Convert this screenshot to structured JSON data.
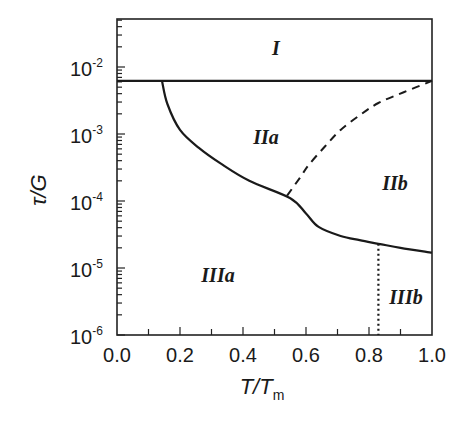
{
  "chart_data": {
    "type": "line",
    "title": "",
    "xlabel": "T/T_m",
    "xlabel_main": "T/T",
    "xlabel_sub": "m",
    "ylabel": "τ/G",
    "xlim": [
      0.0,
      1.0
    ],
    "ylim": [
      1e-06,
      0.05
    ],
    "yscale": "log",
    "grid": false,
    "legend": null,
    "x_ticks": [
      "0.0",
      "0.2",
      "0.4",
      "0.6",
      "0.8",
      "1.0"
    ],
    "y_ticks": [
      {
        "base": "10",
        "exp": "-2",
        "value": 0.01
      },
      {
        "base": "10",
        "exp": "-3",
        "value": 0.001
      },
      {
        "base": "10",
        "exp": "-4",
        "value": 0.0001
      },
      {
        "base": "10",
        "exp": "-5",
        "value": 1e-05
      },
      {
        "base": "10",
        "exp": "-6",
        "value": 1e-06
      }
    ],
    "series": [
      {
        "name": "upper boundary (I / II)",
        "style": "solid",
        "x": [
          0.0,
          1.0
        ],
        "y": [
          0.0062,
          0.0062
        ]
      },
      {
        "name": "lower boundary (II / III)",
        "style": "solid",
        "x": [
          0.143,
          0.16,
          0.2,
          0.26,
          0.33,
          0.42,
          0.55,
          0.6,
          0.64,
          0.71,
          0.77,
          0.83,
          0.9,
          1.0
        ],
        "y": [
          0.0062,
          0.0028,
          0.00115,
          0.00062,
          0.00036,
          0.0002,
          0.00011,
          6.5e-05,
          4.1e-05,
          3e-05,
          2.6e-05,
          2.3e-05,
          2e-05,
          1.7e-05
        ]
      },
      {
        "name": "IIa / IIb boundary",
        "style": "dashed",
        "x": [
          0.54,
          0.58,
          0.61,
          0.66,
          0.71,
          0.77,
          0.83,
          0.91,
          1.0
        ],
        "y": [
          0.00012,
          0.00022,
          0.00035,
          0.00065,
          0.00115,
          0.0019,
          0.0029,
          0.0042,
          0.0062
        ]
      },
      {
        "name": "IIIa / IIIb boundary",
        "style": "dotted",
        "x": [
          0.83,
          0.83
        ],
        "y": [
          2.3e-05,
          1e-06
        ]
      }
    ],
    "annotations": [
      {
        "text": "I",
        "x": 0.5,
        "y": 0.019
      },
      {
        "text": "IIa",
        "x": 0.47,
        "y": 0.0011
      },
      {
        "text": "IIb",
        "x": 0.88,
        "y": 0.00016
      },
      {
        "text": "IIIa",
        "x": 0.33,
        "y": 9e-06
      },
      {
        "text": "IIIb",
        "x": 0.92,
        "y": 3e-06
      }
    ]
  }
}
